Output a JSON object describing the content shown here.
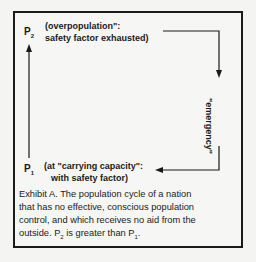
{
  "diagram": {
    "top_state": {
      "label": "P",
      "subscript": "2",
      "line1": "(overpopulation\":",
      "line2": "safety factor exhausted)"
    },
    "right_label": "\"emergency\"",
    "bottom_state": {
      "label": "P",
      "subscript": "1",
      "line1": "(at \"carrying capacity\":",
      "line2": "with safety factor)"
    },
    "caption": {
      "line1": "Exhibit A.   The population cycle of a nation",
      "line2": "that has no effective, conscious population",
      "line3": "control, and which receives no aid from the",
      "line4a": "outside.  P",
      "sub1": "2",
      "line4b": " is greater than P",
      "sub2": "1",
      "line4c": "."
    }
  }
}
